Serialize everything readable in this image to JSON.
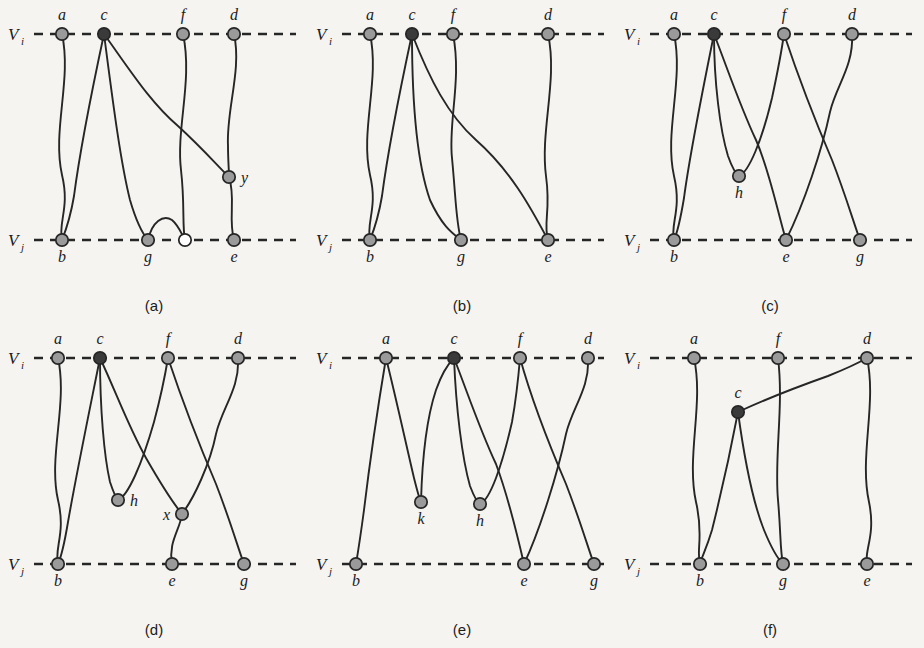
{
  "figure": {
    "title": "",
    "layout": {
      "columns": 3,
      "rows": 2,
      "panel_width": 308,
      "panel_height": 324
    },
    "colors": {
      "background": "#f5f4f1",
      "stroke": "#262626",
      "node_fill": "#9a9a9a",
      "node_fill_dark": "#3a3a3a",
      "node_fill_open": "#ffffff",
      "text": "#1b1b1b"
    },
    "axis_labels": {
      "top": "V",
      "top_sub": "i",
      "bottom": "V",
      "bottom_sub": "j"
    },
    "geometry": {
      "top_y": 34,
      "bottom_y": 240,
      "axis_x_start": 34,
      "axis_x_end": 296,
      "node_radius": 6.2
    }
  },
  "panels": [
    {
      "id": "a",
      "caption": "(a)",
      "nodes": [
        {
          "name": "a",
          "x": 62,
          "y": 34,
          "label": "a",
          "label_pos": "above",
          "fill": "grey"
        },
        {
          "name": "c",
          "x": 104,
          "y": 34,
          "label": "c",
          "label_pos": "above",
          "fill": "dark"
        },
        {
          "name": "f",
          "x": 183,
          "y": 34,
          "label": "f",
          "label_pos": "above",
          "fill": "grey"
        },
        {
          "name": "d",
          "x": 234,
          "y": 34,
          "label": "d",
          "label_pos": "above",
          "fill": "grey"
        },
        {
          "name": "b",
          "x": 62,
          "y": 240,
          "label": "b",
          "label_pos": "below",
          "fill": "grey"
        },
        {
          "name": "g",
          "x": 148,
          "y": 240,
          "label": "g",
          "label_pos": "below",
          "fill": "grey"
        },
        {
          "name": "gp",
          "x": 185,
          "y": 240,
          "label": "",
          "label_pos": "below",
          "fill": "open"
        },
        {
          "name": "e",
          "x": 234,
          "y": 240,
          "label": "e",
          "label_pos": "below",
          "fill": "grey"
        },
        {
          "name": "y",
          "x": 229,
          "y": 177,
          "label": "y",
          "label_pos": "right",
          "fill": "grey"
        }
      ],
      "edges": [
        {
          "from": "a",
          "to": "b",
          "path": "M62,34 C72,80 52,130 62,175 C70,208 58,222 62,240"
        },
        {
          "from": "c",
          "to": "b",
          "path": "M104,34 C92,90 80,150 74,196 C70,220 66,230 62,240"
        },
        {
          "from": "c",
          "to": "g",
          "path": "M104,34 C112,95 120,160 130,200 C137,224 142,233 148,240"
        },
        {
          "from": "c",
          "to": "y",
          "path": "M104,34 C130,70 150,102 178,126 C200,146 216,164 229,177"
        },
        {
          "from": "y",
          "to": "e",
          "path": "M229,177 C236,198 228,218 234,240"
        },
        {
          "from": "d",
          "to": "y",
          "path": "M234,34 C242,70 226,110 228,146 C228,160 229,170 229,177"
        },
        {
          "from": "f",
          "to": "gp",
          "path": "M183,34 C193,80 176,128 181,170 C185,205 182,226 185,240"
        },
        {
          "from": "g",
          "to": "gp",
          "path": "M148,240 C152,222 163,214 172,220 C179,226 181,233 185,240"
        }
      ]
    },
    {
      "id": "b",
      "caption": "(b)",
      "nodes": [
        {
          "name": "a",
          "x": 62,
          "y": 34,
          "label": "a",
          "label_pos": "above",
          "fill": "grey"
        },
        {
          "name": "c",
          "x": 104,
          "y": 34,
          "label": "c",
          "label_pos": "above",
          "fill": "dark"
        },
        {
          "name": "f",
          "x": 145,
          "y": 34,
          "label": "f",
          "label_pos": "above",
          "fill": "grey"
        },
        {
          "name": "d",
          "x": 240,
          "y": 34,
          "label": "d",
          "label_pos": "above",
          "fill": "grey"
        },
        {
          "name": "b",
          "x": 62,
          "y": 240,
          "label": "b",
          "label_pos": "below",
          "fill": "grey"
        },
        {
          "name": "g",
          "x": 153,
          "y": 240,
          "label": "g",
          "label_pos": "below",
          "fill": "grey"
        },
        {
          "name": "e",
          "x": 240,
          "y": 240,
          "label": "e",
          "label_pos": "below",
          "fill": "grey"
        }
      ],
      "edges": [
        {
          "from": "a",
          "to": "b",
          "path": "M62,34 C72,80 52,130 62,175 C70,208 58,222 62,240"
        },
        {
          "from": "c",
          "to": "b",
          "path": "M104,34 C92,90 80,150 74,196 C70,220 66,230 62,240"
        },
        {
          "from": "c",
          "to": "g",
          "path": "M104,34 C104,96 108,160 122,200 C134,226 144,233 153,240"
        },
        {
          "from": "c",
          "to": "e",
          "path": "M104,34 C122,80 140,115 168,140 C202,170 222,206 240,240"
        },
        {
          "from": "f",
          "to": "g",
          "path": "M145,34 C154,80 140,122 144,158 C148,200 148,222 153,240"
        },
        {
          "from": "d",
          "to": "e",
          "path": "M240,34 C250,80 232,130 238,176 C243,212 235,222 240,240"
        }
      ]
    },
    {
      "id": "c",
      "caption": "(c)",
      "nodes": [
        {
          "name": "a",
          "x": 58,
          "y": 34,
          "label": "a",
          "label_pos": "above",
          "fill": "grey"
        },
        {
          "name": "c",
          "x": 98,
          "y": 34,
          "label": "c",
          "label_pos": "above",
          "fill": "dark"
        },
        {
          "name": "f",
          "x": 168,
          "y": 34,
          "label": "f",
          "label_pos": "above",
          "fill": "grey"
        },
        {
          "name": "d",
          "x": 236,
          "y": 34,
          "label": "d",
          "label_pos": "above",
          "fill": "grey"
        },
        {
          "name": "b",
          "x": 58,
          "y": 240,
          "label": "b",
          "label_pos": "below",
          "fill": "grey"
        },
        {
          "name": "e",
          "x": 170,
          "y": 240,
          "label": "e",
          "label_pos": "below",
          "fill": "grey"
        },
        {
          "name": "g",
          "x": 244,
          "y": 240,
          "label": "g",
          "label_pos": "below",
          "fill": "grey"
        },
        {
          "name": "h",
          "x": 123,
          "y": 176,
          "label": "h",
          "label_pos": "below",
          "fill": "grey"
        }
      ],
      "edges": [
        {
          "from": "a",
          "to": "b",
          "path": "M58,34 C68,80 48,132 58,176 C66,210 54,224 58,240"
        },
        {
          "from": "c",
          "to": "b",
          "path": "M98,34 C86,94 74,152 68,198 C64,222 62,231 58,240"
        },
        {
          "from": "c",
          "to": "h",
          "path": "M98,34 C98,82 104,130 112,156 C117,170 120,174 123,176"
        },
        {
          "from": "h",
          "to": "f",
          "path": "M123,176 C133,172 146,140 156,98 C162,70 166,48 168,34"
        },
        {
          "from": "c",
          "to": "e",
          "path": "M98,34 C112,70 124,106 140,140 C154,172 162,214 170,240"
        },
        {
          "from": "f",
          "to": "g",
          "path": "M168,34 C180,70 198,118 216,160 C230,196 238,224 244,240"
        },
        {
          "from": "d",
          "to": "e",
          "path": "M236,34 C238,66 220,86 214,112 C206,150 188,204 170,240"
        }
      ]
    },
    {
      "id": "d",
      "caption": "(d)",
      "nodes": [
        {
          "name": "a",
          "x": 58,
          "y": 34,
          "label": "a",
          "label_pos": "above",
          "fill": "grey"
        },
        {
          "name": "c",
          "x": 100,
          "y": 34,
          "label": "c",
          "label_pos": "above",
          "fill": "dark"
        },
        {
          "name": "f",
          "x": 168,
          "y": 34,
          "label": "f",
          "label_pos": "above",
          "fill": "grey"
        },
        {
          "name": "d",
          "x": 238,
          "y": 34,
          "label": "d",
          "label_pos": "above",
          "fill": "grey"
        },
        {
          "name": "b",
          "x": 58,
          "y": 240,
          "label": "b",
          "label_pos": "below",
          "fill": "grey"
        },
        {
          "name": "e",
          "x": 172,
          "y": 240,
          "label": "e",
          "label_pos": "below",
          "fill": "grey"
        },
        {
          "name": "g",
          "x": 244,
          "y": 240,
          "label": "g",
          "label_pos": "below",
          "fill": "grey"
        },
        {
          "name": "h",
          "x": 118,
          "y": 176,
          "label": "h",
          "label_pos": "right",
          "fill": "grey"
        },
        {
          "name": "x",
          "x": 182,
          "y": 190,
          "label": "x",
          "label_pos": "left",
          "fill": "grey"
        }
      ],
      "edges": [
        {
          "from": "a",
          "to": "b",
          "path": "M58,34 C68,80 48,132 58,176 C66,210 54,224 58,240"
        },
        {
          "from": "c",
          "to": "b",
          "path": "M100,34 C88,94 76,152 68,198 C64,222 62,231 58,240"
        },
        {
          "from": "c",
          "to": "h",
          "path": "M100,34 C100,84 104,132 110,158 C114,170 116,174 118,176"
        },
        {
          "from": "h",
          "to": "f",
          "path": "M118,176 C128,172 142,140 154,98 C162,68 166,46 168,34"
        },
        {
          "from": "c",
          "to": "x",
          "path": "M100,34 C116,68 128,102 146,134 C162,162 174,180 182,190"
        },
        {
          "from": "x",
          "to": "e",
          "path": "M182,190 C180,206 168,218 172,240"
        },
        {
          "from": "f",
          "to": "g",
          "path": "M168,34 C180,70 198,118 216,160 C230,196 238,224 244,240"
        },
        {
          "from": "d",
          "to": "x",
          "path": "M238,34 C240,64 222,84 216,110 C210,140 194,174 182,190"
        }
      ]
    },
    {
      "id": "e",
      "caption": "(e)",
      "nodes": [
        {
          "name": "a",
          "x": 78,
          "y": 34,
          "label": "a",
          "label_pos": "above",
          "fill": "grey"
        },
        {
          "name": "c",
          "x": 146,
          "y": 34,
          "label": "c",
          "label_pos": "above",
          "fill": "dark"
        },
        {
          "name": "f",
          "x": 212,
          "y": 34,
          "label": "f",
          "label_pos": "above",
          "fill": "grey"
        },
        {
          "name": "d",
          "x": 280,
          "y": 34,
          "label": "d",
          "label_pos": "above",
          "fill": "grey"
        },
        {
          "name": "b",
          "x": 48,
          "y": 240,
          "label": "b",
          "label_pos": "below",
          "fill": "grey"
        },
        {
          "name": "e",
          "x": 216,
          "y": 240,
          "label": "e",
          "label_pos": "below",
          "fill": "grey"
        },
        {
          "name": "g",
          "x": 286,
          "y": 240,
          "label": "g",
          "label_pos": "below",
          "fill": "grey"
        },
        {
          "name": "k",
          "x": 113,
          "y": 178,
          "label": "k",
          "label_pos": "below",
          "fill": "grey"
        },
        {
          "name": "h",
          "x": 172,
          "y": 180,
          "label": "h",
          "label_pos": "below",
          "fill": "grey"
        }
      ],
      "edges": [
        {
          "from": "a",
          "to": "b",
          "path": "M78,34 C70,82 62,136 56,186 C52,216 50,228 48,240"
        },
        {
          "from": "a",
          "to": "k",
          "path": "M78,34 C88,74 98,120 106,154 C110,170 112,176 113,178"
        },
        {
          "from": "k",
          "to": "c",
          "path": "M113,178 C114,140 118,96 128,66 C135,46 142,38 146,34"
        },
        {
          "from": "c",
          "to": "h",
          "path": "M146,34 C148,84 154,134 162,162 C167,175 170,179 172,180"
        },
        {
          "from": "h",
          "to": "f",
          "path": "M172,180 C182,176 194,142 204,98 C209,70 211,46 212,34"
        },
        {
          "from": "c",
          "to": "e",
          "path": "M146,34 C160,70 172,106 188,140 C200,172 210,214 216,240"
        },
        {
          "from": "f",
          "to": "g",
          "path": "M212,34 C222,70 240,118 258,160 C272,196 280,224 286,240"
        },
        {
          "from": "d",
          "to": "e",
          "path": "M280,34 C282,64 264,84 258,110 C250,148 232,206 216,240"
        }
      ]
    },
    {
      "id": "f",
      "caption": "(f)",
      "nodes": [
        {
          "name": "a",
          "x": 78,
          "y": 34,
          "label": "a",
          "label_pos": "above",
          "fill": "grey"
        },
        {
          "name": "f",
          "x": 162,
          "y": 34,
          "label": "f",
          "label_pos": "above",
          "fill": "grey"
        },
        {
          "name": "d",
          "x": 251,
          "y": 34,
          "label": "d",
          "label_pos": "above",
          "fill": "grey"
        },
        {
          "name": "c",
          "x": 122,
          "y": 88,
          "label": "c",
          "label_pos": "above",
          "fill": "dark"
        },
        {
          "name": "b",
          "x": 84,
          "y": 240,
          "label": "b",
          "label_pos": "below",
          "fill": "grey"
        },
        {
          "name": "g",
          "x": 167,
          "y": 240,
          "label": "g",
          "label_pos": "below",
          "fill": "grey"
        },
        {
          "name": "e",
          "x": 251,
          "y": 240,
          "label": "e",
          "label_pos": "below",
          "fill": "grey"
        }
      ],
      "edges": [
        {
          "from": "a",
          "to": "b",
          "path": "M78,34 C88,80 70,132 80,178 C88,212 80,226 84,240"
        },
        {
          "from": "c",
          "to": "b",
          "path": "M122,88 C114,130 104,174 96,206 C90,226 86,232 84,240"
        },
        {
          "from": "c",
          "to": "g",
          "path": "M122,88 C128,132 136,176 148,206 C157,228 162,235 167,240"
        },
        {
          "from": "c",
          "to": "d",
          "path": "M122,88 C148,76 178,64 212,52 C232,44 244,38 251,34"
        },
        {
          "from": "f",
          "to": "g",
          "path": "M162,34 C168,82 158,132 162,176 C165,210 164,226 167,240"
        },
        {
          "from": "d",
          "to": "e",
          "path": "M251,34 C261,80 243,132 253,178 C260,212 248,226 251,240"
        }
      ]
    }
  ]
}
